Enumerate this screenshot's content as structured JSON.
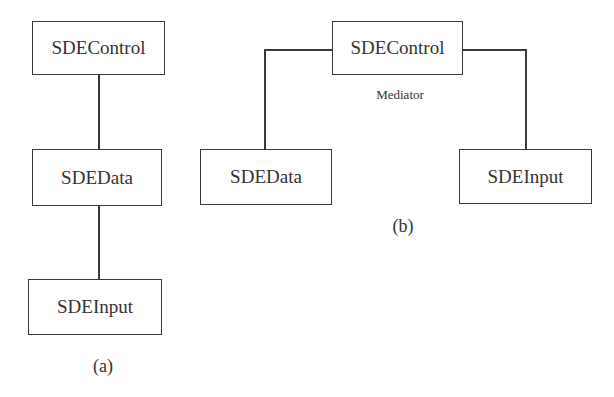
{
  "diagram_a": {
    "nodes": [
      {
        "id": "sdecontrol",
        "label": "SDEControl"
      },
      {
        "id": "sdedata",
        "label": "SDEData"
      },
      {
        "id": "sdeinput",
        "label": "SDEInput"
      }
    ],
    "edges": [
      {
        "from": "sdecontrol",
        "to": "sdedata"
      },
      {
        "from": "sdedata",
        "to": "sdeinput"
      }
    ],
    "caption": "(a)"
  },
  "diagram_b": {
    "nodes": [
      {
        "id": "sdecontrol",
        "label": "SDEControl"
      },
      {
        "id": "sdedata",
        "label": "SDEData"
      },
      {
        "id": "sdeinput",
        "label": "SDEInput"
      }
    ],
    "edges": [
      {
        "from": "sdecontrol",
        "to": "sdedata"
      },
      {
        "from": "sdecontrol",
        "to": "sdeinput"
      }
    ],
    "annotation": "Mediator",
    "caption": "(b)"
  },
  "colors": {
    "line": "#3a3a3a",
    "text": "#333333",
    "background": "#ffffff"
  }
}
